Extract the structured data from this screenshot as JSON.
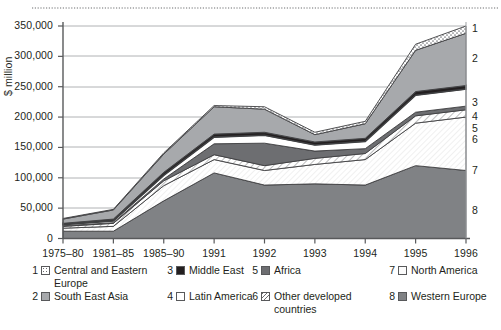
{
  "chart_data": {
    "type": "area",
    "stacked": true,
    "title": "",
    "xlabel": "",
    "ylabel": "$ million",
    "ylim": [
      0,
      350000
    ],
    "ytick_labels": [
      "0",
      "50,000",
      "100,000",
      "150,000",
      "200,000",
      "250,000",
      "300,000",
      "350,000"
    ],
    "ytick_values": [
      0,
      50000,
      100000,
      150000,
      200000,
      250000,
      300000,
      350000
    ],
    "grid": true,
    "legend_position": "bottom",
    "categories": [
      "1975–80",
      "1981–85",
      "1985–90",
      "1991",
      "1992",
      "1993",
      "1994",
      "1995",
      "1996"
    ],
    "stack_order_bottom_to_top": [
      8,
      7,
      6,
      5,
      4,
      3,
      2,
      1
    ],
    "series": [
      {
        "key": "8",
        "name": "Western Europe",
        "pattern": "dark-gray",
        "values": [
          12000,
          12000,
          62000,
          108000,
          88000,
          90000,
          88000,
          120000,
          112000
        ]
      },
      {
        "key": "7",
        "name": "North America",
        "pattern": "very-light",
        "values": [
          5000,
          8000,
          25000,
          22000,
          24000,
          32000,
          42000,
          70000,
          88000
        ]
      },
      {
        "key": "6",
        "name": "Other developed countries",
        "pattern": "hatch",
        "values": [
          3000,
          5000,
          8000,
          8000,
          8000,
          10000,
          10000,
          12000,
          12000
        ]
      },
      {
        "key": "5",
        "name": "Africa",
        "pattern": "dark-gray",
        "values": [
          1000,
          1000,
          3000,
          18000,
          37000,
          12000,
          8000,
          6000,
          6000
        ]
      },
      {
        "key": "4",
        "name": "Latin America",
        "pattern": "white",
        "values": [
          2000,
          3000,
          6000,
          11000,
          13000,
          10000,
          12000,
          28000,
          28000
        ]
      },
      {
        "key": "3",
        "name": "Middle East",
        "pattern": "black",
        "values": [
          2000,
          3000,
          5000,
          5000,
          5000,
          5000,
          5000,
          6000,
          6000
        ]
      },
      {
        "key": "2",
        "name": "South East Asia",
        "pattern": "mid-gray",
        "values": [
          7000,
          15000,
          30000,
          45000,
          38000,
          12000,
          24000,
          68000,
          86000
        ]
      },
      {
        "key": "1",
        "name": "Central and Eastern Europe",
        "pattern": "dots",
        "values": [
          1000,
          1000,
          2000,
          2000,
          4000,
          4000,
          4000,
          10000,
          12000
        ]
      }
    ],
    "totals": [
      33000,
      48000,
      141000,
      219000,
      217000,
      175000,
      193000,
      320000,
      350000
    ],
    "right_edge_labels": [
      {
        "label": "1",
        "series": "Central and Eastern Europe"
      },
      {
        "label": "2",
        "series": "South East Asia"
      },
      {
        "label": "3",
        "series": "Middle East"
      },
      {
        "label": "4",
        "series": "Latin America"
      },
      {
        "label": "5",
        "series": "Africa"
      },
      {
        "label": "6",
        "series": "Other developed countries"
      },
      {
        "label": "7",
        "series": "North America"
      },
      {
        "label": "8",
        "series": "Western Europe"
      }
    ]
  },
  "legend": {
    "items": [
      {
        "num": "1",
        "label": "Central and Eastern Europe",
        "swatch": "sw-dots"
      },
      {
        "num": "2",
        "label": "South East Asia",
        "swatch": "sw-midgray"
      },
      {
        "num": "3",
        "label": "Middle East",
        "swatch": "sw-black"
      },
      {
        "num": "4",
        "label": "Latin America",
        "swatch": "sw-white"
      },
      {
        "num": "5",
        "label": "Africa",
        "swatch": "sw-darkgray"
      },
      {
        "num": "6",
        "label": "Other developed countries",
        "swatch": "sw-hatch"
      },
      {
        "num": "7",
        "label": "North America",
        "swatch": "sw-vlight"
      },
      {
        "num": "8",
        "label": "Western Europe",
        "swatch": "sw-weur"
      }
    ]
  },
  "colors": {
    "axis": "#58595b",
    "grid": "#a7a9ac",
    "text": "#231f20",
    "dark_gray": "#6d6e71",
    "mid_gray": "#a7a9ac",
    "black": "#231f20",
    "white": "#ffffff",
    "very_light": "#fbfbfb",
    "western_europe": "#808285"
  }
}
